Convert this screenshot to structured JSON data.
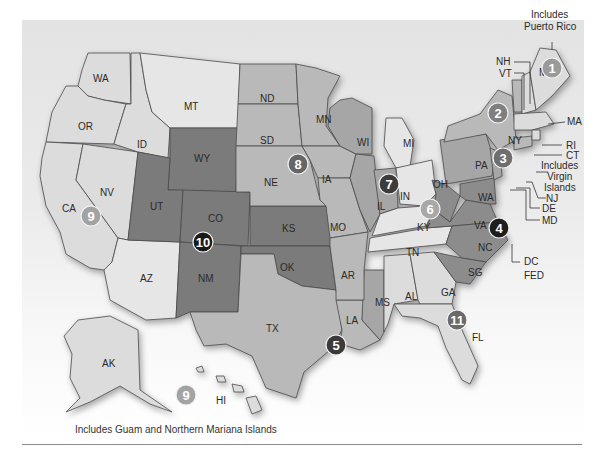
{
  "map": {
    "title": "U.S. Federal Judicial Circuits",
    "notes": {
      "puerto_rico": [
        "Includes",
        "Puerto Rico"
      ],
      "virgin_islands": [
        "Includes",
        "Virgin",
        "Islands"
      ],
      "guam": "Includes Guam and Northern Mariana Islands"
    },
    "callouts": {
      "nh": "NH",
      "vt": "VT",
      "ma": "MA",
      "ri": "RI",
      "ct": "CT",
      "nj": "NJ",
      "de": "DE",
      "md": "MD",
      "dc": "DC",
      "fed": "FED"
    },
    "states": {
      "wa": "WA",
      "or": "OR",
      "ca": "CA",
      "nv": "NV",
      "id": "ID",
      "mt": "MT",
      "wy": "WY",
      "ut": "UT",
      "az": "AZ",
      "co": "CO",
      "nm": "NM",
      "nd": "ND",
      "sd": "SD",
      "ne": "NE",
      "ks": "KS",
      "ok": "OK",
      "tx": "TX",
      "mn": "MN",
      "ia": "IA",
      "mo": "MO",
      "ar": "AR",
      "la": "LA",
      "wi": "WI",
      "il": "IL",
      "in": "IN",
      "mi": "MI",
      "oh": "OH",
      "ky": "KY",
      "tn": "TN",
      "ms": "MS",
      "al": "AL",
      "ga": "GA",
      "fl": "FL",
      "sc": "SG",
      "nc": "NC",
      "va": "VA",
      "wv": "WA",
      "pa": "PA",
      "ny": "NY",
      "me": "ME",
      "ak": "AK",
      "hi": "HI"
    },
    "circuits": [
      {
        "id": "1",
        "label": "1",
        "x": 552,
        "y": 68,
        "color": "#9a9a9a"
      },
      {
        "id": "2",
        "label": "2",
        "x": 498,
        "y": 113,
        "color": "#7f7f7f"
      },
      {
        "id": "3",
        "label": "3",
        "x": 503,
        "y": 158,
        "color": "#6e6e6e"
      },
      {
        "id": "4",
        "label": "4",
        "x": 499,
        "y": 228,
        "color": "#1e1e1e"
      },
      {
        "id": "5",
        "label": "5",
        "x": 336,
        "y": 345,
        "color": "#3a3a3a"
      },
      {
        "id": "6",
        "label": "6",
        "x": 430,
        "y": 209,
        "color": "#a8a8a8"
      },
      {
        "id": "7",
        "label": "7",
        "x": 389,
        "y": 184,
        "color": "#3c3c3c"
      },
      {
        "id": "8",
        "label": "8",
        "x": 298,
        "y": 164,
        "color": "#666666"
      },
      {
        "id": "9a",
        "label": "9",
        "x": 91,
        "y": 216,
        "color": "#a3a3a3"
      },
      {
        "id": "9b",
        "label": "9",
        "x": 186,
        "y": 395,
        "color": "#a3a3a3"
      },
      {
        "id": "10",
        "label": "10",
        "x": 203,
        "y": 242,
        "color": "#1a1a1a"
      },
      {
        "id": "11",
        "label": "11",
        "x": 457,
        "y": 320,
        "color": "#6a6a6a"
      }
    ]
  }
}
